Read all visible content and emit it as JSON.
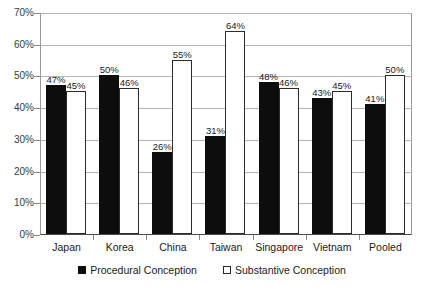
{
  "chart_data": {
    "type": "bar",
    "title": "",
    "subtitle": "",
    "xlabel": "",
    "ylabel": "",
    "categories": [
      "Japan",
      "Korea",
      "China",
      "Taiwan",
      "Singapore",
      "Vietnam",
      "Pooled"
    ],
    "series": [
      {
        "name": "Procedural Conception",
        "color": "#0d0d0d",
        "values": [
          47,
          50,
          26,
          31,
          48,
          43,
          41
        ],
        "labels": [
          "47%",
          "50%",
          "26%",
          "31%",
          "48%",
          "43%",
          "41%"
        ]
      },
      {
        "name": "Substantive Conception",
        "color": "#ffffff",
        "values": [
          45,
          46,
          55,
          64,
          46,
          45,
          50
        ],
        "labels": [
          "45%",
          "46%",
          "55%",
          "64%",
          "46%",
          "45%",
          "50%"
        ]
      }
    ],
    "ylim": [
      0,
      70
    ],
    "ytick_values": [
      0,
      10,
      20,
      30,
      40,
      50,
      60,
      70
    ],
    "ytick_labels": [
      "0%",
      "10%",
      "20%",
      "30%",
      "40%",
      "50%",
      "60%",
      "70%"
    ],
    "grid": true,
    "legend_position": "bottom",
    "value_labels_shown": true
  },
  "legend": {
    "items": [
      {
        "label": "Procedural Conception",
        "marker": "filled-square-icon"
      },
      {
        "label": "Substantive Conception",
        "marker": "hollow-square-icon"
      }
    ]
  },
  "colors": {
    "procedural": "#0d0d0d",
    "substantive": "#ffffff",
    "bar_outline": "#2b2b2b",
    "gridline": "#b4b4b4",
    "axis": "#4a4a4a",
    "background": "#ffffff"
  }
}
